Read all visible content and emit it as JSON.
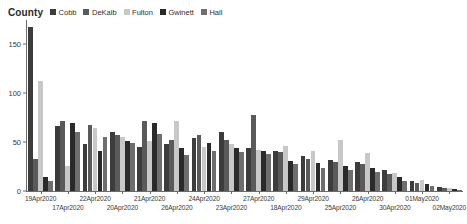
{
  "legend": {
    "title": "County",
    "items": [
      {
        "label": "Cobb",
        "color": "#3c3c3c"
      },
      {
        "label": "DeKalb",
        "color": "#5a5a5a"
      },
      {
        "label": "Fulton",
        "color": "#c8c8c8"
      },
      {
        "label": "Gwinett",
        "color": "#2a2a2a"
      },
      {
        "label": "Hall",
        "color": "#6e6e6e"
      }
    ]
  },
  "chart_data": {
    "type": "bar",
    "title": "",
    "xlabel": "",
    "ylabel": "",
    "grid": false,
    "legend_position": "top-left",
    "ylim": [
      0,
      175
    ],
    "yticks": [
      0,
      50,
      100,
      150
    ],
    "categories": [
      "19Apr2020",
      "17Apr2020",
      "22Apr2020",
      "20Apr2020",
      "21Apr2020",
      "26Apr2020",
      "24Apr2020",
      "23Apr2020",
      "27Apr2020",
      "18Apr2020",
      "29Apr2020",
      "25Apr2020",
      "26Apr2020",
      "30Apr2020",
      "01May2020",
      "02May2020"
    ],
    "series": [
      {
        "name": "Cobb",
        "color": "#3c3c3c",
        "values": [
          168,
          67,
          48,
          60,
          45,
          48,
          54,
          60,
          44,
          41,
          36,
          32,
          30,
          21,
          10,
          4
        ]
      },
      {
        "name": "DeKalb",
        "color": "#5a5a5a",
        "values": [
          33,
          72,
          68,
          57,
          72,
          52,
          57,
          52,
          78,
          40,
          33,
          30,
          28,
          17,
          8,
          3
        ]
      },
      {
        "name": "Fulton",
        "color": "#c8c8c8",
        "values": [
          113,
          26,
          64,
          55,
          51,
          72,
          45,
          48,
          42,
          46,
          41,
          52,
          39,
          18,
          11,
          3
        ]
      },
      {
        "name": "Gwinett",
        "color": "#2a2a2a",
        "values": [
          14,
          70,
          41,
          51,
          70,
          44,
          49,
          44,
          41,
          31,
          29,
          26,
          24,
          14,
          7,
          2
        ]
      },
      {
        "name": "Hall",
        "color": "#6e6e6e",
        "values": [
          10,
          60,
          55,
          49,
          58,
          37,
          41,
          40,
          38,
          28,
          24,
          21,
          19,
          10,
          5,
          1
        ]
      }
    ]
  },
  "axis": {
    "y_tick_labels": [
      "0",
      "50",
      "100",
      "150"
    ]
  }
}
